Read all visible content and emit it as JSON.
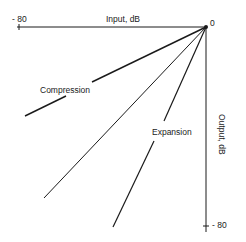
{
  "diagram": {
    "x_axis": {
      "label": "Input, dB",
      "min_label": "- 80",
      "max_label": "0"
    },
    "y_axis": {
      "label": "Output, dB",
      "min_label": "- 80"
    },
    "curves": [
      {
        "name": "compression",
        "label": "Compression"
      },
      {
        "name": "unity",
        "label": ""
      },
      {
        "name": "expansion",
        "label": "Expansion"
      }
    ],
    "colors": {
      "line": "#1a1a1a",
      "background": "#ffffff"
    }
  }
}
